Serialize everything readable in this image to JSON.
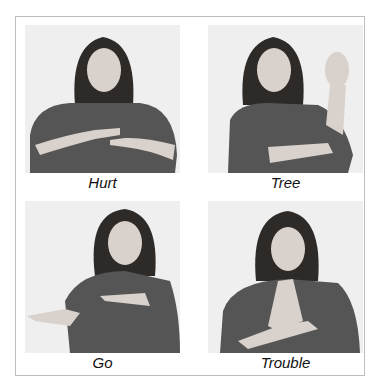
{
  "figure": {
    "panels": [
      {
        "id": "hurt",
        "caption": "Hurt",
        "description": "Woman signing; index fingers pointing toward each other at chest"
      },
      {
        "id": "tree",
        "caption": "Tree",
        "description": "Woman signing; right arm raised with open hand, left hand under elbow"
      },
      {
        "id": "go",
        "caption": "Go",
        "description": "Woman signing; both index fingers pointing to her right"
      },
      {
        "id": "trouble",
        "caption": "Trouble",
        "description": "Woman signing; hands pressed together in front of chest"
      }
    ],
    "colors": {
      "border": "#bdbdbd",
      "photo_bg": "#eeeeee",
      "shirt": "#555555",
      "hair": "#2e2a28",
      "skin": "#d9d2cc"
    }
  }
}
